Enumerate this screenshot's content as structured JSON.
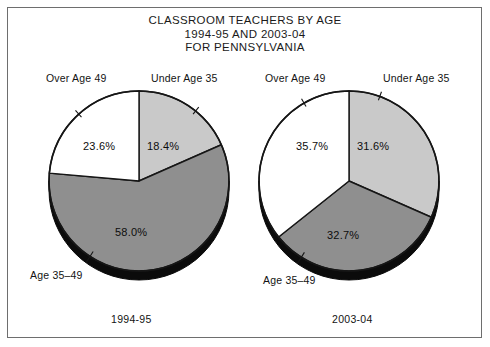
{
  "chart_data": {
    "type": "pie",
    "title": "CLASSROOM TEACHERS BY AGE",
    "subtitle": "1994-95 AND 2003-04",
    "subtitle2": "FOR PENNSYLVANIA",
    "title_lines": [
      "CLASSROOM TEACHERS BY AGE",
      "1994-95 AND 2003-04",
      "FOR PENNSYLVANIA"
    ],
    "xlabel": "",
    "ylabel": "",
    "legend_position": "none",
    "grid": false,
    "colors": {
      "under_35": "#c9c9c9",
      "age_35_49": "#8f8f8f",
      "over_49": "#ffffff",
      "outline": "#161616",
      "rim": "#0b0b0b",
      "frame": "#6e6e6e"
    },
    "categories": [
      "Under Age 35",
      "Age 35–49",
      "Over Age 49"
    ],
    "charts": [
      {
        "name": "1994-95",
        "caption": "1994-95",
        "slices": [
          {
            "label": "Under Age 35",
            "value": 18.4,
            "value_text": "18.4%",
            "color": "#c9c9c9"
          },
          {
            "label": "Age 35–49",
            "value": 58.0,
            "value_text": "58.0%",
            "color": "#8f8f8f"
          },
          {
            "label": "Over Age 49",
            "value": 23.6,
            "value_text": "23.6%",
            "color": "#ffffff"
          }
        ]
      },
      {
        "name": "2003-04",
        "caption": "2003-04",
        "slices": [
          {
            "label": "Under Age 35",
            "value": 31.6,
            "value_text": "31.6%",
            "color": "#c9c9c9"
          },
          {
            "label": "Age 35–49",
            "value": 32.7,
            "value_text": "32.7%",
            "color": "#8f8f8f"
          },
          {
            "label": "Over Age 49",
            "value": 35.7,
            "value_text": "35.7%",
            "color": "#ffffff"
          }
        ]
      }
    ]
  },
  "title": {
    "line1": "CLASSROOM TEACHERS BY AGE",
    "line2": "1994-95 AND 2003-04",
    "line3": "FOR PENNSYLVANIA"
  },
  "left_chart": {
    "caption": "1994-95",
    "label_over_49": "Over Age 49",
    "label_under_35": "Under Age 35",
    "label_age_35_49": "Age 35–49",
    "pct_over_49": "23.6%",
    "pct_under_35": "18.4%",
    "pct_age_35_49": "58.0%"
  },
  "right_chart": {
    "caption": "2003-04",
    "label_over_49": "Over Age 49",
    "label_under_35": "Under Age 35",
    "label_age_35_49": "Age 35–49",
    "pct_over_49": "35.7%",
    "pct_under_35": "31.6%",
    "pct_age_35_49": "32.7%"
  }
}
